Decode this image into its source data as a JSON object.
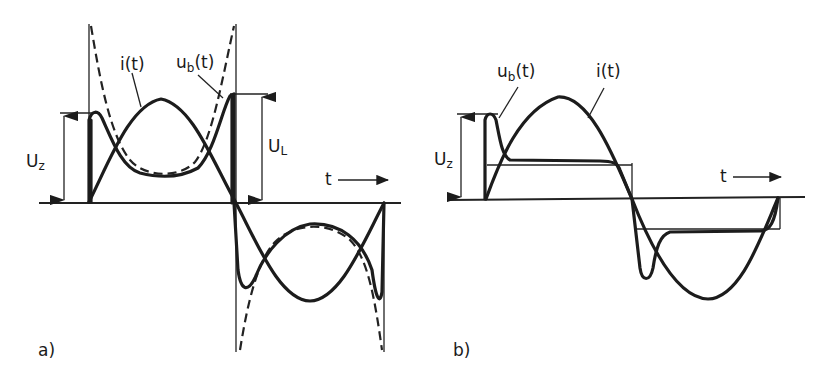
{
  "figure": {
    "panels": [
      {
        "id": "a",
        "caption": "a)",
        "labels": {
          "current": "i(t)",
          "voltage_main": "u",
          "voltage_sub": "b",
          "voltage_suffix": "(t)",
          "zener_main": "U",
          "zener_sub": "z",
          "load_main": "U",
          "load_sub": "L",
          "time": "t"
        },
        "description": "Current i(t) and voltage u_b(t) over one period with dashed ideal voltage curve; U_z and U_L magnitude arrows"
      },
      {
        "id": "b",
        "caption": "b)",
        "labels": {
          "current": "i(t)",
          "voltage_main": "u",
          "voltage_sub": "b",
          "voltage_suffix": "(t)",
          "zener_main": "U",
          "zener_sub": "z",
          "time": "t"
        },
        "description": "Sinusoidal current i(t) with clipped voltage u_b(t) showing overshoot then plateau; U_z magnitude arrow"
      }
    ],
    "colors": {
      "ink": "#1c1c1c",
      "background": "#ffffff"
    }
  }
}
